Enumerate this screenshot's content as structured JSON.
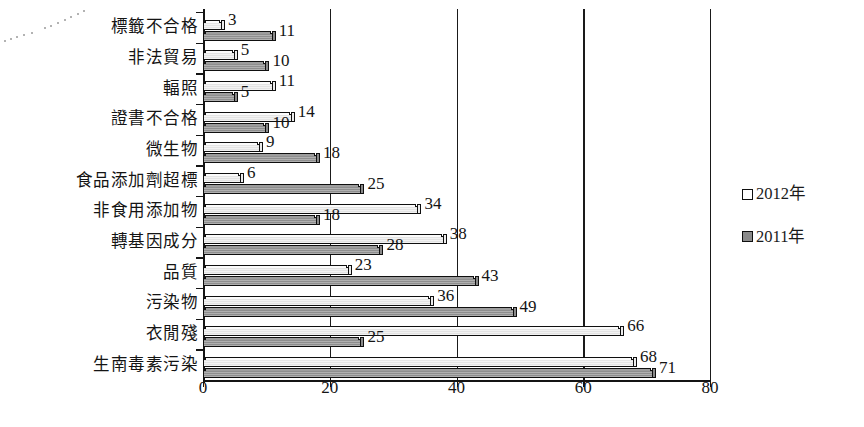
{
  "chart_data": {
    "type": "bar",
    "orientation": "horizontal",
    "title": "",
    "xlabel": "",
    "ylabel": "",
    "xlim": [
      0,
      80
    ],
    "xticks": [
      0,
      20,
      40,
      60,
      80
    ],
    "xtick_labels": [
      "0",
      "20",
      "40",
      "60",
      "80"
    ],
    "grid": true,
    "legend_position": "right",
    "categories": [
      "標籤不合格",
      "非法貿易",
      "輻照",
      "證書不合格",
      "微生物",
      "食品添加劑超標",
      "非食用添加物",
      "轉基因成分",
      "品質",
      "污染物",
      "衣閒殘",
      "生南毒素污染"
    ],
    "series": [
      {
        "name": "2012年",
        "style": "light",
        "color": "#f2f2f2",
        "values": [
          3,
          5,
          11,
          14,
          9,
          6,
          34,
          38,
          23,
          36,
          66,
          68
        ]
      },
      {
        "name": "2011年",
        "style": "dark",
        "color": "#8e8e8e",
        "values": [
          11,
          10,
          5,
          10,
          18,
          25,
          18,
          28,
          43,
          49,
          25,
          71
        ]
      }
    ]
  },
  "legend": {
    "items": [
      {
        "label": "2012年",
        "swatch": "light"
      },
      {
        "label": "2011年",
        "swatch": "dark"
      }
    ]
  }
}
